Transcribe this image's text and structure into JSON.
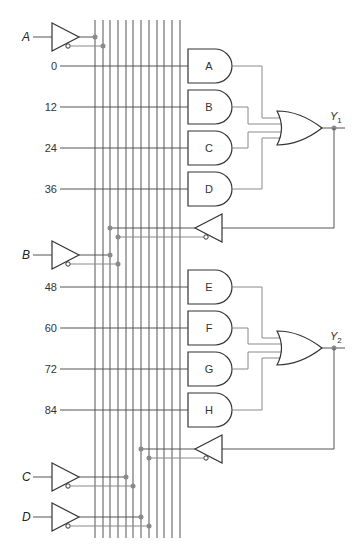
{
  "diagram": {
    "type": "logic-circuit",
    "inputs": [
      {
        "label": "A",
        "y": 37
      },
      {
        "label": "B",
        "y": 255
      },
      {
        "label": "C",
        "y": 477
      },
      {
        "label": "D",
        "y": 517
      }
    ],
    "fuse_labels": [
      {
        "label": "0",
        "y": 66
      },
      {
        "label": "12",
        "y": 107
      },
      {
        "label": "24",
        "y": 148
      },
      {
        "label": "36",
        "y": 189
      },
      {
        "label": "48",
        "y": 287
      },
      {
        "label": "60",
        "y": 328
      },
      {
        "label": "72",
        "y": 369
      },
      {
        "label": "84",
        "y": 410
      }
    ],
    "and_gates": [
      {
        "label": "A",
        "y": 66
      },
      {
        "label": "B",
        "y": 107
      },
      {
        "label": "C",
        "y": 148
      },
      {
        "label": "D",
        "y": 189
      },
      {
        "label": "E",
        "y": 287
      },
      {
        "label": "F",
        "y": 328
      },
      {
        "label": "G",
        "y": 369
      },
      {
        "label": "H",
        "y": 410
      }
    ],
    "or_gates": [
      {
        "output": "Y",
        "subscript": "1",
        "y": 128
      },
      {
        "output": "Y",
        "subscript": "2",
        "y": 348
      }
    ],
    "feedback_buffers": [
      {
        "y": 228
      },
      {
        "y": 449
      }
    ],
    "bus_lines_x": [
      95,
      103,
      110,
      118,
      126,
      133,
      141,
      149,
      157,
      164,
      172,
      180
    ],
    "colors": {
      "line": "#555555",
      "wire_gray": "#8a8a8a",
      "dot": "#8a8a8a",
      "gate_stroke": "#333333"
    }
  }
}
